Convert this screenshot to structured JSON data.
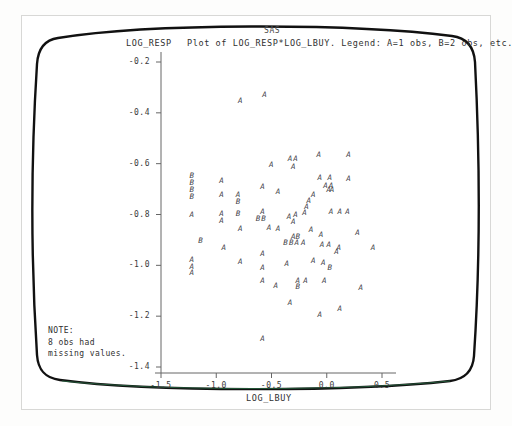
{
  "window": {
    "app_title": "SAS"
  },
  "plot": {
    "title": "Plot of LOG_RESP*LOG_LBUY. Legend: A=1 obs, B=2 obs, etc.",
    "y_axis_name": "LOG_RESP",
    "x_axis_name": "LOG_LBUY"
  },
  "note": {
    "heading": "NOTE:",
    "line1": "8 obs had",
    "line2": "missing values."
  },
  "colors": {
    "bezel": "#111111",
    "axis": "#555555",
    "text": "#2f2f2f",
    "marker": "#44444a",
    "phosphor_tint": "#2e7d4f"
  },
  "chart_data": {
    "type": "scatter",
    "title": "Plot of LOG_RESP*LOG_LBUY. Legend: A=1 obs, B=2 obs, etc.",
    "subtitle": "SAS",
    "xlabel": "LOG_LBUY",
    "ylabel": "LOG_RESP",
    "xlim": [
      -1.65,
      0.72
    ],
    "ylim": [
      -1.45,
      -0.16
    ],
    "xticks": [
      -1.5,
      -1.0,
      -0.5,
      0.0,
      0.5
    ],
    "xtick_labels": [
      "-1.5",
      "-1.0",
      "-0.5",
      "0.0",
      "0.5"
    ],
    "yticks": [
      -0.2,
      -0.4,
      -0.6,
      -0.8,
      -1.0,
      -1.2,
      -1.4
    ],
    "ytick_labels": [
      "-0.2",
      "-0.4",
      "-0.6",
      "-0.8",
      "-1.0",
      "-1.2",
      "-1.4"
    ],
    "grid": false,
    "legend": "A=1 obs, B=2 obs, etc.",
    "marker_encoding": {
      "A": 1,
      "B": 2
    },
    "missing_obs": 8,
    "points": [
      {
        "x": -0.78,
        "y": -0.355,
        "label": "A"
      },
      {
        "x": -0.56,
        "y": -0.33,
        "label": "A"
      },
      {
        "x": -0.5,
        "y": -0.605,
        "label": "A"
      },
      {
        "x": -0.33,
        "y": -0.583,
        "label": "A"
      },
      {
        "x": -0.28,
        "y": -0.583,
        "label": "A"
      },
      {
        "x": -0.07,
        "y": -0.567,
        "label": "A"
      },
      {
        "x": 0.2,
        "y": -0.567,
        "label": "A"
      },
      {
        "x": -1.22,
        "y": -0.648,
        "label": "B"
      },
      {
        "x": -1.22,
        "y": -0.675,
        "label": "B"
      },
      {
        "x": -1.22,
        "y": -0.703,
        "label": "B"
      },
      {
        "x": -1.22,
        "y": -0.73,
        "label": "B"
      },
      {
        "x": -0.95,
        "y": -0.668,
        "label": "A"
      },
      {
        "x": -0.95,
        "y": -0.725,
        "label": "A"
      },
      {
        "x": -0.8,
        "y": -0.722,
        "label": "A"
      },
      {
        "x": -0.8,
        "y": -0.752,
        "label": "B"
      },
      {
        "x": -0.58,
        "y": -0.69,
        "label": "A"
      },
      {
        "x": -0.44,
        "y": -0.712,
        "label": "A"
      },
      {
        "x": -0.3,
        "y": -0.612,
        "label": "A"
      },
      {
        "x": -0.06,
        "y": -0.655,
        "label": "A"
      },
      {
        "x": 0.03,
        "y": -0.655,
        "label": "A"
      },
      {
        "x": -0.01,
        "y": -0.688,
        "label": "A"
      },
      {
        "x": 0.04,
        "y": -0.688,
        "label": "A"
      },
      {
        "x": 0.02,
        "y": -0.705,
        "label": "A"
      },
      {
        "x": 0.05,
        "y": -0.705,
        "label": "A"
      },
      {
        "x": 0.2,
        "y": -0.66,
        "label": "A"
      },
      {
        "x": -0.12,
        "y": -0.722,
        "label": "A"
      },
      {
        "x": -0.16,
        "y": -0.748,
        "label": "A"
      },
      {
        "x": -0.18,
        "y": -0.772,
        "label": "A"
      },
      {
        "x": -1.22,
        "y": -0.8,
        "label": "A"
      },
      {
        "x": -0.95,
        "y": -0.797,
        "label": "A"
      },
      {
        "x": -0.95,
        "y": -0.825,
        "label": "A"
      },
      {
        "x": -0.8,
        "y": -0.797,
        "label": "B"
      },
      {
        "x": -0.58,
        "y": -0.79,
        "label": "A"
      },
      {
        "x": -0.62,
        "y": -0.818,
        "label": "B"
      },
      {
        "x": -0.57,
        "y": -0.818,
        "label": "B"
      },
      {
        "x": -0.34,
        "y": -0.81,
        "label": "A"
      },
      {
        "x": -0.3,
        "y": -0.83,
        "label": "A"
      },
      {
        "x": -0.28,
        "y": -0.8,
        "label": "A"
      },
      {
        "x": -0.2,
        "y": -0.795,
        "label": "A"
      },
      {
        "x": 0.04,
        "y": -0.79,
        "label": "A"
      },
      {
        "x": 0.12,
        "y": -0.79,
        "label": "A"
      },
      {
        "x": 0.19,
        "y": -0.79,
        "label": "A"
      },
      {
        "x": -0.78,
        "y": -0.858,
        "label": "A"
      },
      {
        "x": -0.52,
        "y": -0.855,
        "label": "A"
      },
      {
        "x": -0.44,
        "y": -0.858,
        "label": "A"
      },
      {
        "x": -0.3,
        "y": -0.888,
        "label": "A"
      },
      {
        "x": -0.26,
        "y": -0.888,
        "label": "B"
      },
      {
        "x": -0.14,
        "y": -0.862,
        "label": "A"
      },
      {
        "x": -0.05,
        "y": -0.88,
        "label": "A"
      },
      {
        "x": 0.28,
        "y": -0.872,
        "label": "A"
      },
      {
        "x": -1.14,
        "y": -0.905,
        "label": "B"
      },
      {
        "x": -0.93,
        "y": -0.93,
        "label": "A"
      },
      {
        "x": -0.37,
        "y": -0.912,
        "label": "B"
      },
      {
        "x": -0.32,
        "y": -0.912,
        "label": "B"
      },
      {
        "x": -0.27,
        "y": -0.912,
        "label": "A"
      },
      {
        "x": -0.21,
        "y": -0.912,
        "label": "A"
      },
      {
        "x": -0.04,
        "y": -0.92,
        "label": "A"
      },
      {
        "x": 0.02,
        "y": -0.92,
        "label": "A"
      },
      {
        "x": 0.11,
        "y": -0.932,
        "label": "A"
      },
      {
        "x": 0.42,
        "y": -0.93,
        "label": "A"
      },
      {
        "x": -1.22,
        "y": -0.978,
        "label": "A"
      },
      {
        "x": -1.22,
        "y": -1.005,
        "label": "A"
      },
      {
        "x": -1.22,
        "y": -1.032,
        "label": "A"
      },
      {
        "x": -0.78,
        "y": -0.988,
        "label": "A"
      },
      {
        "x": -0.58,
        "y": -0.955,
        "label": "A"
      },
      {
        "x": -0.58,
        "y": -1.012,
        "label": "A"
      },
      {
        "x": -0.36,
        "y": -0.995,
        "label": "A"
      },
      {
        "x": -0.12,
        "y": -0.982,
        "label": "A"
      },
      {
        "x": -0.03,
        "y": -0.99,
        "label": "A"
      },
      {
        "x": 0.03,
        "y": -1.012,
        "label": "B"
      },
      {
        "x": 0.09,
        "y": -0.948,
        "label": "A"
      },
      {
        "x": -0.58,
        "y": -1.062,
        "label": "A"
      },
      {
        "x": -0.46,
        "y": -1.08,
        "label": "A"
      },
      {
        "x": -0.26,
        "y": -1.06,
        "label": "A"
      },
      {
        "x": -0.26,
        "y": -1.085,
        "label": "B"
      },
      {
        "x": -0.19,
        "y": -1.062,
        "label": "A"
      },
      {
        "x": -0.02,
        "y": -1.06,
        "label": "A"
      },
      {
        "x": 0.31,
        "y": -1.09,
        "label": "A"
      },
      {
        "x": -0.33,
        "y": -1.148,
        "label": "A"
      },
      {
        "x": 0.12,
        "y": -1.172,
        "label": "A"
      },
      {
        "x": -0.06,
        "y": -1.195,
        "label": "A"
      },
      {
        "x": -0.58,
        "y": -1.288,
        "label": "A"
      }
    ]
  }
}
